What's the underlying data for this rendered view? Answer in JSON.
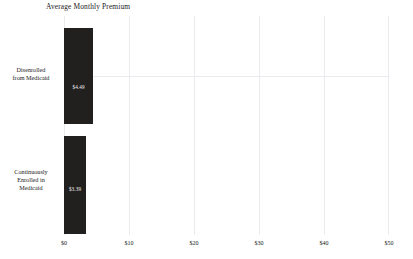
{
  "chart_data": {
    "type": "bar",
    "orientation": "horizontal",
    "title": "Average Monthly Premium",
    "xlabel": "",
    "ylabel": "",
    "xlim": [
      0,
      50
    ],
    "xticks": [
      "$0",
      "$10",
      "$20",
      "$30",
      "$40",
      "$50"
    ],
    "xtick_values": [
      0,
      10,
      20,
      30,
      40,
      50
    ],
    "grid": true,
    "legend": null,
    "categories": [
      "Disenrolled from Medicaid",
      "Continuously Enrolled in Medicaid"
    ],
    "values": [
      4.49,
      3.39
    ],
    "data_labels": [
      "$4.49",
      "$3.39"
    ],
    "bar_color": "#221f1f",
    "gridline_color": "#e9ebee",
    "label_color": "#1a1a1a"
  },
  "categories_display": [
    {
      "lines": [
        "Disenrolled",
        "from Medicaid"
      ]
    },
    {
      "lines": [
        "Continuously",
        "Enrolled in",
        "Medicaid"
      ]
    }
  ]
}
